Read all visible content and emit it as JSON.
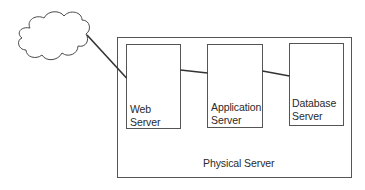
{
  "diagram": {
    "cloud": {
      "label": "",
      "icon": "cloud-icon"
    },
    "container": {
      "label": "Physical Server"
    },
    "nodes": [
      {
        "id": "web",
        "line1": "Web",
        "line2": "Server"
      },
      {
        "id": "app",
        "line1": "Application",
        "line2": "Server"
      },
      {
        "id": "db",
        "line1": "Database",
        "line2": "Server"
      }
    ],
    "edges": [
      {
        "from": "cloud",
        "to": "web"
      },
      {
        "from": "web",
        "to": "app"
      },
      {
        "from": "app",
        "to": "db"
      }
    ],
    "colors": {
      "stroke": "#4a4a4a",
      "text": "#2a2a2a",
      "background": "#ffffff"
    }
  }
}
